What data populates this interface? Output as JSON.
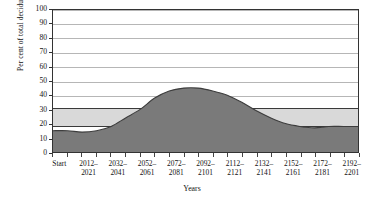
{
  "chart_data": {
    "type": "area",
    "title": "",
    "xlabel": "Years",
    "ylabel": "Per cent of total deciduous forest",
    "ylim": [
      0,
      100
    ],
    "ytick_values": [
      0,
      10,
      20,
      30,
      40,
      50,
      60,
      70,
      80,
      90,
      100
    ],
    "grid": true,
    "legend": "none",
    "categories": [
      "Start",
      "2012–2021",
      "2032–2041",
      "2052–2061",
      "2072–2081",
      "2092–2101",
      "2112–2121",
      "2132–2141",
      "2152–2161",
      "2172–2181",
      "2192–2201"
    ],
    "series": [
      {
        "name": "Per cent of total deciduous forest",
        "color": "#7a7a7a",
        "x": [
          0,
          1,
          2,
          3,
          4,
          5,
          6,
          7,
          8,
          9,
          10,
          11,
          12,
          13,
          14,
          15,
          16,
          17,
          18,
          19,
          20,
          21
        ],
        "values": [
          15,
          15,
          14,
          15,
          18,
          24,
          30,
          38,
          43,
          45,
          45,
          43,
          40,
          35,
          29,
          24,
          20,
          18,
          17,
          18,
          18,
          18
        ]
      }
    ],
    "reference_band": {
      "name": "reference range band",
      "color": "#d9d9d9",
      "line_color": "#3a3a3a",
      "lower": 19,
      "upper": 32
    },
    "notes": {
      "start_value": 15,
      "peak_value": 45,
      "peak_period": "2052–2061",
      "end_value": 18
    }
  },
  "axes": {
    "y_title": "Per cent of total deciduous forest",
    "x_title": "Years",
    "y_ticks": [
      "100",
      "90",
      "80",
      "70",
      "60",
      "50",
      "40",
      "30",
      "20",
      "10",
      "0"
    ],
    "x_labels": [
      {
        "top": "Start",
        "bottom": ""
      },
      {
        "top": "2012–",
        "bottom": "2021"
      },
      {
        "top": "2032–",
        "bottom": "2041"
      },
      {
        "top": "2052–",
        "bottom": "2061"
      },
      {
        "top": "2072–",
        "bottom": "2081"
      },
      {
        "top": "2092–",
        "bottom": "2101"
      },
      {
        "top": "2112–",
        "bottom": "2121"
      },
      {
        "top": "2132–",
        "bottom": "2141"
      },
      {
        "top": "2152–",
        "bottom": "2161"
      },
      {
        "top": "2172–",
        "bottom": "2181"
      },
      {
        "top": "2192–",
        "bottom": "2201"
      }
    ]
  },
  "colors": {
    "area_fill": "#7a7a7a",
    "band_fill": "#d9d9d9",
    "band_line": "#3a3a3a",
    "grid": "#b6b6b6",
    "frame": "#333333",
    "text": "#111111",
    "background": "#ffffff"
  }
}
